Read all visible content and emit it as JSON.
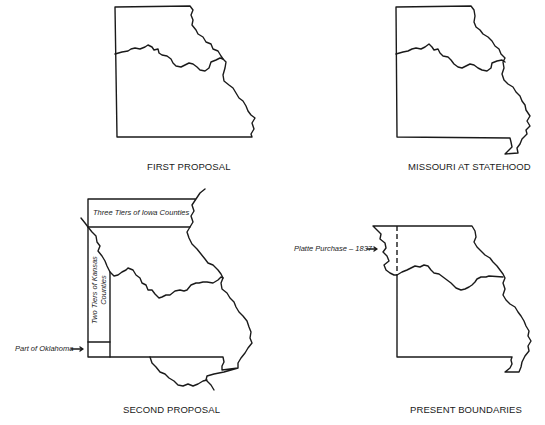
{
  "panels": [
    {
      "id": "first-proposal",
      "caption": "FIRST PROPOSAL"
    },
    {
      "id": "missouri-at-statehood",
      "caption": "MISSOURI AT STATEHOOD"
    },
    {
      "id": "second-proposal",
      "caption": "SECOND PROPOSAL",
      "annotations": {
        "iowa": "Three Tiers of Iowa Counties",
        "kansas_line1": "Two Tiers of Kansas",
        "kansas_line2": "Counties",
        "oklahoma": "Part of Oklahoma"
      }
    },
    {
      "id": "present-boundaries",
      "caption": "PRESENT BOUNDARIES",
      "annotations": {
        "platte": "Platte Purchase – 1837"
      }
    }
  ],
  "colors": {
    "line": "#1a1a1a",
    "background": "#ffffff"
  }
}
